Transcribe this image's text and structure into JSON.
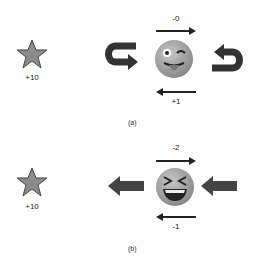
{
  "panels": [
    {
      "caption": "(a)",
      "star_reward": "+10",
      "top_arrow_label": "-0",
      "bottom_arrow_label": "+1",
      "emoji": "winking-face-with-tongue",
      "side_arrows": "rotating"
    },
    {
      "caption": "(b)",
      "star_reward": "+10",
      "top_arrow_label": "-2",
      "bottom_arrow_label": "-1",
      "emoji": "grinning-squinting-face",
      "side_arrows": "pushing-left"
    }
  ],
  "colors": {
    "star_fill": "#8c8c8c",
    "arrow": "#333333",
    "emoji_face": "#a8a8a8"
  }
}
